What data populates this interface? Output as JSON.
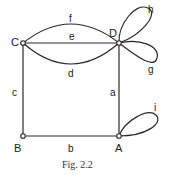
{
  "figure": {
    "caption": "Fig. 2.2",
    "colors": {
      "stroke": "#2a2a2a",
      "text": "#222222",
      "background": "#ffffff"
    }
  },
  "vertices": [
    {
      "id": "A",
      "label": "A"
    },
    {
      "id": "B",
      "label": "B"
    },
    {
      "id": "C",
      "label": "C"
    },
    {
      "id": "D",
      "label": "D"
    }
  ],
  "edges": [
    {
      "id": "a",
      "label": "a",
      "from": "A",
      "to": "D",
      "type": "straight"
    },
    {
      "id": "b",
      "label": "b",
      "from": "B",
      "to": "A",
      "type": "straight"
    },
    {
      "id": "c",
      "label": "c",
      "from": "C",
      "to": "B",
      "type": "straight"
    },
    {
      "id": "d",
      "label": "d",
      "from": "C",
      "to": "D",
      "type": "arc-lower"
    },
    {
      "id": "e",
      "label": "e",
      "from": "C",
      "to": "D",
      "type": "straight"
    },
    {
      "id": "f",
      "label": "f",
      "from": "C",
      "to": "D",
      "type": "arc-upper"
    },
    {
      "id": "g",
      "label": "g",
      "from": "D",
      "to": "D",
      "type": "loop"
    },
    {
      "id": "h",
      "label": "h",
      "from": "D",
      "to": "D",
      "type": "loop"
    },
    {
      "id": "i",
      "label": "i",
      "from": "A",
      "to": "A",
      "type": "loop"
    }
  ]
}
